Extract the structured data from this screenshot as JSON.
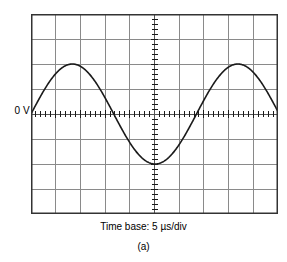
{
  "figure": {
    "name": "oscilloscope-display-figure",
    "panel_caption": "(a)",
    "timebase_caption": "Time base: 5 µs/div",
    "zero_volt_label": "0 V"
  },
  "scope": {
    "graticule": {
      "columns": 10,
      "rows": 8,
      "width_px": 247,
      "height_px": 200,
      "border_color": "#333333",
      "grid_line_color": "#8a8a8a",
      "center_axis_color": "#555555",
      "background_color": "#ffffff",
      "tick_count_per_division": 5,
      "tick_length_px": 4
    },
    "trace": {
      "color": "#1a1a1a",
      "width_px": 1.6
    },
    "settings": {
      "time_base": "5 µs/div"
    }
  },
  "chart_data": {
    "type": "line",
    "title": "Time base: 5 µs/div",
    "subtitle": "(a)",
    "xlabel": "Time",
    "ylabel": "Voltage",
    "xunit": "divisions",
    "yunit": "divisions",
    "xlim": [
      0,
      10
    ],
    "ylim": [
      -4,
      4
    ],
    "grid": true,
    "grid_divisions_x": 10,
    "grid_divisions_y": 8,
    "legend": "none",
    "annotations": [
      {
        "text": "0 V",
        "x": 0,
        "y": 0,
        "position": "left-of-axis"
      }
    ],
    "waveform": {
      "shape": "sine",
      "amplitude_divisions": 2.0,
      "period_divisions": 6.7,
      "phase_divisions": 0,
      "offset_divisions": 0,
      "cycles_visible": 1.5
    },
    "series": [
      {
        "name": "Channel 1",
        "x": [
          0.0,
          0.25,
          0.5,
          0.75,
          1.0,
          1.25,
          1.5,
          1.75,
          2.0,
          2.25,
          2.5,
          2.75,
          3.0,
          3.25,
          3.5,
          3.75,
          4.0,
          4.25,
          4.5,
          4.75,
          5.0,
          5.25,
          5.5,
          5.75,
          6.0,
          6.25,
          6.5,
          6.75,
          7.0,
          7.25,
          7.5,
          7.75,
          8.0,
          8.25,
          8.5,
          8.75,
          9.0,
          9.25,
          9.5,
          9.75,
          10.0
        ],
        "y": [
          0.0,
          0.46,
          0.9,
          1.3,
          1.62,
          1.85,
          1.98,
          2.0,
          1.9,
          1.7,
          1.4,
          1.03,
          0.6,
          0.14,
          -0.32,
          -0.77,
          -1.18,
          -1.53,
          -1.79,
          -1.95,
          -2.0,
          -1.94,
          -1.77,
          -1.5,
          -1.15,
          -0.73,
          -0.28,
          0.19,
          0.64,
          1.06,
          1.42,
          1.71,
          1.91,
          2.0,
          1.98,
          1.85,
          1.62,
          1.3,
          0.9,
          0.46,
          0.0
        ],
        "zero_crossings": [
          0.0,
          3.35,
          6.7,
          10.0
        ],
        "peaks": [
          {
            "x": 1.68,
            "y": 2.0
          },
          {
            "x": 8.38,
            "y": 2.0
          }
        ],
        "troughs": [
          {
            "x": 5.03,
            "y": -2.0
          }
        ]
      }
    ]
  }
}
